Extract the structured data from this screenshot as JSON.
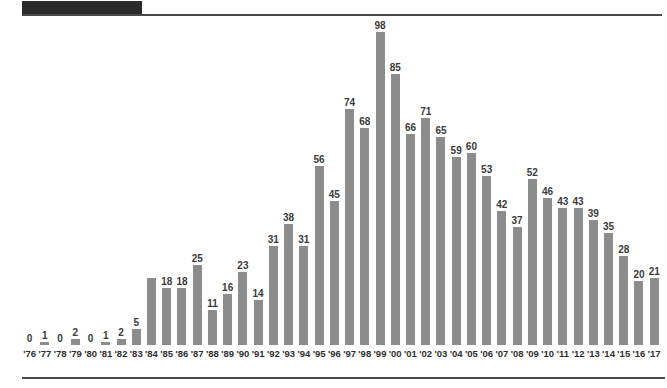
{
  "masthead": {
    "block_color": "#2b2b2b",
    "rule_color": "#4a4a4a"
  },
  "style": {
    "bar_color": "#8c8c8c",
    "label_color": "#3a3a3a",
    "tick_color": "#2e2e2e",
    "background": "#ffffff"
  },
  "chart_data": {
    "type": "bar",
    "title": "",
    "subtitle": "",
    "xlabel": "",
    "ylabel": "",
    "grid": false,
    "legend": null,
    "ylim": [
      0,
      98
    ],
    "categories": [
      "'76",
      "'77",
      "'78",
      "'79",
      "'80",
      "'81",
      "'82",
      "'83",
      "'84",
      "'85",
      "'86",
      "'87",
      "'88",
      "'89",
      "'90",
      "'91",
      "'92",
      "'93",
      "'94",
      "'95",
      "'96",
      "'97",
      "'98",
      "'99",
      "'00",
      "'01",
      "'02",
      "'03",
      "'04",
      "'05",
      "'06",
      "'07",
      "'08",
      "'09",
      "'10",
      "'11",
      "'12",
      "'13",
      "'14",
      "'15",
      "'16",
      "'17"
    ],
    "values": [
      0,
      1,
      0,
      2,
      0,
      1,
      2,
      5,
      21,
      18,
      18,
      25,
      11,
      16,
      23,
      14,
      31,
      38,
      31,
      56,
      45,
      74,
      68,
      98,
      85,
      66,
      71,
      65,
      59,
      60,
      53,
      42,
      37,
      52,
      46,
      43,
      43,
      39,
      35,
      28,
      20,
      21
    ],
    "data_labels": [
      "0",
      "1",
      "0",
      "2",
      "0",
      "1",
      "2",
      "5",
      "",
      "18",
      "18",
      "25",
      "11",
      "16",
      "23",
      "14",
      "31",
      "38",
      "31",
      "56",
      "45",
      "74",
      "68",
      "98",
      "85",
      "66",
      "71",
      "65",
      "59",
      "60",
      "53",
      "42",
      "37",
      "52",
      "46",
      "43",
      "43",
      "39",
      "35",
      "28",
      "20",
      "21"
    ]
  }
}
